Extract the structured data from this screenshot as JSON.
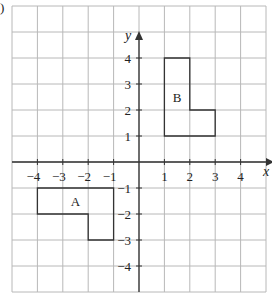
{
  "diagram": {
    "type": "coordinate-grid",
    "corner_mark": ")",
    "axes": {
      "x_label": "x",
      "y_label": "y",
      "x_ticks": [
        "-4",
        "-3",
        "-2",
        "-1",
        "1",
        "2",
        "3",
        "4"
      ],
      "y_ticks": [
        "4",
        "3",
        "2",
        "1",
        "-1",
        "-2",
        "-3",
        "-4"
      ],
      "x_range": [
        -5,
        5
      ],
      "y_range": [
        -5,
        6
      ]
    },
    "shapes": [
      {
        "label": "A",
        "vertices": [
          [
            -4,
            -1
          ],
          [
            -1,
            -1
          ],
          [
            -1,
            -3
          ],
          [
            -2,
            -3
          ],
          [
            -2,
            -2
          ],
          [
            -4,
            -2
          ]
        ]
      },
      {
        "label": "B",
        "vertices": [
          [
            1,
            1
          ],
          [
            1,
            4
          ],
          [
            2,
            4
          ],
          [
            2,
            2
          ],
          [
            3,
            2
          ],
          [
            3,
            1
          ]
        ]
      }
    ],
    "colors": {
      "grid": "#b8b8b8",
      "axis": "#333333",
      "shape": "#333333"
    }
  }
}
